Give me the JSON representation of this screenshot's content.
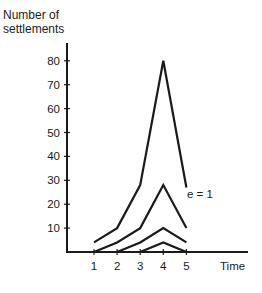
{
  "chart_data": {
    "type": "line",
    "title": "",
    "ylabel": "Number of settlements",
    "ylabel_lines": [
      "Number of",
      "settlements"
    ],
    "xlabel": "Time",
    "x": [
      1,
      2,
      3,
      4,
      5
    ],
    "yticks": [
      10,
      20,
      30,
      40,
      50,
      60,
      70,
      80
    ],
    "xticks": [
      1,
      2,
      3,
      4,
      5
    ],
    "ylim": [
      0,
      85
    ],
    "xlim": [
      0,
      7
    ],
    "grid": false,
    "legend": "none",
    "series": [
      {
        "name": "e = 1",
        "x": [
          1,
          2,
          3,
          4,
          5
        ],
        "values": [
          4,
          10,
          28,
          80,
          27
        ]
      },
      {
        "name": "curve 2",
        "x": [
          1,
          2,
          3,
          4,
          5
        ],
        "values": [
          0,
          4,
          10,
          28,
          10
        ]
      },
      {
        "name": "curve 3",
        "x": [
          2,
          3,
          4,
          5
        ],
        "values": [
          0,
          4,
          10,
          4
        ]
      },
      {
        "name": "curve 4",
        "x": [
          3,
          4,
          5
        ],
        "values": [
          0,
          4,
          0
        ]
      }
    ],
    "annotations": [
      {
        "text": "e = 1",
        "x": 5,
        "y": 24
      }
    ]
  }
}
